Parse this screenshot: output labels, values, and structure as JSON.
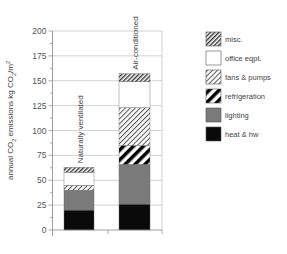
{
  "chart_data": {
    "type": "bar",
    "stacked": true,
    "title": "",
    "xlabel": "",
    "ylabel": "annual CO2 emissions kg CO2/m2",
    "ylim": [
      0,
      200
    ],
    "yticks": [
      0,
      25,
      50,
      75,
      100,
      125,
      150,
      175,
      200
    ],
    "grid": true,
    "legend_position": "right",
    "categories": [
      "Naturally ventilated",
      "Air-conditioned"
    ],
    "series": [
      {
        "name": "heat & hw",
        "pattern": "solid-black",
        "values": [
          20,
          26
        ]
      },
      {
        "name": "lighting",
        "pattern": "solid-gray",
        "values": [
          20,
          40
        ]
      },
      {
        "name": "refrigeration",
        "pattern": "thick-diagonal",
        "values": [
          0,
          19
        ]
      },
      {
        "name": "fans & pumps",
        "pattern": "fine-diagonal",
        "values": [
          5,
          38
        ]
      },
      {
        "name": "office eqpt.",
        "pattern": "white",
        "values": [
          13,
          26
        ]
      },
      {
        "name": "misc.",
        "pattern": "dense-diagonal",
        "values": [
          5,
          8
        ]
      }
    ],
    "totals": [
      63,
      157
    ]
  },
  "legend": {
    "items": [
      {
        "label": "misc.",
        "pattern": "dense-diagonal"
      },
      {
        "label": "office eqpt.",
        "pattern": "white"
      },
      {
        "label": "fans & pumps",
        "pattern": "fine-diagonal"
      },
      {
        "label": "refrigeration",
        "pattern": "thick-diagonal"
      },
      {
        "label": "lighting",
        "pattern": "solid-gray"
      },
      {
        "label": "heat & hw",
        "pattern": "solid-black"
      }
    ]
  },
  "colors": {
    "black": "#0a0a0a",
    "gray": "#7a7a7a",
    "axis": "#888888",
    "grid": "#bdbdbd"
  }
}
